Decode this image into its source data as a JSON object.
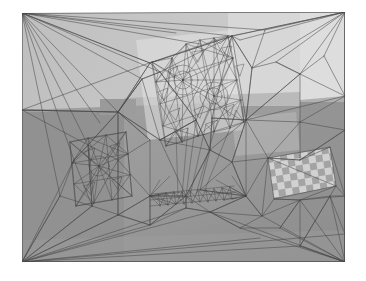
{
  "figure": {
    "canvas_width": 366,
    "canvas_height": 281,
    "margin_color": "#ffffff"
  },
  "palette": {
    "margin": "#ffffff",
    "background_upper_wall": "#c9c9c9",
    "background_bright_panel": "#dcdcdc",
    "background_bright_panel_2": "#e4e4e4",
    "background_lower_floor": "#9b9b9b",
    "background_mid_band": "#a8a8a8",
    "background_dark_band": "#8f8f8f",
    "background_shadow": "#858585",
    "checker_light": "#d8d8d8",
    "checker_dark": "#a6a6a6",
    "mesh_edge": "#4a4a4a",
    "mesh_edge_dense": "#3c3c3c",
    "highlight_white": "#efefef"
  },
  "scene_regions": [
    {
      "name": "upper-wall",
      "fill": "#c9c9c9",
      "points": "22,13 345,12 345,95 22,110"
    },
    {
      "name": "bright-panel-top-right",
      "fill": "#dcdcdc",
      "points": "228,12 300,12 300,108 228,104"
    },
    {
      "name": "bright-panel-far-right",
      "fill": "#e2e2e2",
      "points": "300,12 345,12 345,100 300,104"
    },
    {
      "name": "dark-band-left",
      "fill": "#8f8f8f",
      "points": "22,112 122,112 122,262 22,262"
    },
    {
      "name": "dark-object-block",
      "fill": "#9a9a9a",
      "points": "100,100 135,100 135,118 100,118"
    },
    {
      "name": "floor-lower",
      "fill": "#9b9b9b",
      "points": "22,112 345,100 345,262 22,262"
    },
    {
      "name": "wall-shadow-right",
      "fill": "#919191",
      "points": "300,104 345,100 345,200 300,205"
    }
  ],
  "mesh": {
    "boundary_quad": [
      {
        "label": "top-left",
        "x": 22,
        "y": 13
      },
      {
        "label": "top-right",
        "x": 345,
        "y": 12
      },
      {
        "label": "bottom-right",
        "x": 345,
        "y": 262
      },
      {
        "label": "bottom-left",
        "x": 22,
        "y": 262
      }
    ],
    "edge_color": "#4a4a4a",
    "edge_width": 0.55,
    "dense_edge_width": 0.4,
    "vertex_count_approx": 340,
    "triangle_count_approx": 640,
    "clusters": [
      {
        "name": "dense-cluster-upper-center",
        "cx": 186,
        "cy": 86,
        "radius": 62,
        "density": "very-high"
      },
      {
        "name": "medium-cluster-left",
        "cx": 98,
        "cy": 168,
        "radius": 45,
        "density": "medium"
      },
      {
        "name": "dense-band-bottom-center",
        "cx": 190,
        "cy": 200,
        "radius": 42,
        "density": "high"
      },
      {
        "name": "sparse-region-right",
        "cx": 290,
        "cy": 120,
        "radius": 60,
        "density": "low"
      }
    ]
  },
  "checkerboard": {
    "name": "calibration-target",
    "corners": [
      {
        "x": 268,
        "y": 158
      },
      {
        "x": 330,
        "y": 148
      },
      {
        "x": 336,
        "y": 186
      },
      {
        "x": 274,
        "y": 198
      }
    ],
    "cols": 9,
    "rows": 5,
    "light": "#dcdcdc",
    "dark": "#a8a8a8"
  },
  "chart_data": {
    "type": "scatter",
    "xlabel": "",
    "ylabel": "",
    "xlim": [
      22,
      345
    ],
    "ylim": [
      12,
      262
    ],
    "grid": false,
    "legend": null,
    "series": [
      {
        "name": "mesh-vertices",
        "note": "Representative node positions of the triangulation",
        "x": [
          22,
          345,
          345,
          22,
          186,
          98,
          190,
          290,
          228,
          160,
          212,
          150,
          250,
          300,
          120,
          70,
          265,
          330,
          176,
          205
        ],
        "y": [
          13,
          12,
          262,
          262,
          86,
          168,
          200,
          120,
          104,
          60,
          118,
          140,
          150,
          205,
          130,
          190,
          158,
          148,
          196,
          203
        ]
      }
    ]
  }
}
